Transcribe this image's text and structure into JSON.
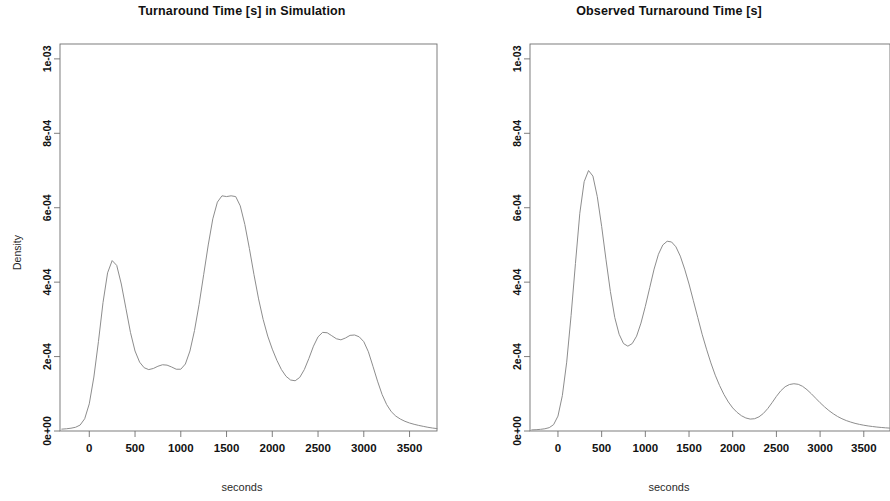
{
  "figure": {
    "background": "#ffffff",
    "line_color": "#8d8d8d",
    "axis_color": "#6f6f6f",
    "text_color": "#111111"
  },
  "panels": [
    {
      "id": "simulation",
      "title": "Turnaround Time [s] in Simulation",
      "xlabel": "seconds",
      "ylabel": "Density"
    },
    {
      "id": "observed",
      "title": "Observed Turnaround Time [s]",
      "xlabel": "seconds",
      "ylabel": "Density"
    }
  ],
  "axis": {
    "x_ticks": [
      0,
      500,
      1000,
      1500,
      2000,
      2500,
      3000,
      3500
    ],
    "x_tick_labels": [
      "0",
      "500",
      "1000",
      "1500",
      "2000",
      "2500",
      "3000",
      "3500"
    ],
    "y_ticks": [
      0,
      0.0002,
      0.0004,
      0.0006,
      0.0008,
      0.001
    ],
    "y_tick_labels": [
      "0e+00",
      "2e-04",
      "4e-04",
      "6e-04",
      "8e-04",
      "1e-03"
    ],
    "xlim": [
      -320,
      3800
    ],
    "ylim": [
      0,
      0.00104
    ]
  },
  "chart_data": [
    {
      "type": "line",
      "title": "Turnaround Time [s] in Simulation",
      "xlabel": "seconds",
      "ylabel": "Density",
      "xlim": [
        -320,
        3800
      ],
      "ylim": [
        0,
        0.00104
      ],
      "grid": false,
      "legend": "none",
      "x": [
        -300,
        -250,
        -200,
        -150,
        -100,
        -50,
        0,
        50,
        100,
        150,
        200,
        250,
        300,
        350,
        400,
        450,
        500,
        550,
        600,
        650,
        700,
        750,
        800,
        850,
        900,
        950,
        1000,
        1050,
        1100,
        1150,
        1200,
        1250,
        1300,
        1350,
        1400,
        1450,
        1500,
        1550,
        1600,
        1650,
        1700,
        1750,
        1800,
        1850,
        1900,
        1950,
        2000,
        2050,
        2100,
        2150,
        2200,
        2250,
        2300,
        2350,
        2400,
        2450,
        2500,
        2550,
        2600,
        2650,
        2700,
        2750,
        2800,
        2850,
        2900,
        2950,
        3000,
        3050,
        3100,
        3150,
        3200,
        3250,
        3300,
        3350,
        3400,
        3450,
        3500,
        3550,
        3600,
        3650,
        3700,
        3750,
        3800
      ],
      "y": [
        5e-06,
        6e-06,
        7.5e-06,
        1e-05,
        1.6e-05,
        3.3e-05,
        7.3e-05,
        0.000145,
        0.00024,
        0.000345,
        0.000425,
        0.000458,
        0.000445,
        0.000395,
        0.00033,
        0.000265,
        0.000215,
        0.000185,
        0.00017,
        0.000165,
        0.000168,
        0.000174,
        0.000178,
        0.000177,
        0.000172,
        0.000166,
        0.000166,
        0.00018,
        0.000215,
        0.00027,
        0.00034,
        0.00042,
        0.0005,
        0.00057,
        0.000615,
        0.000632,
        0.00063,
        0.000632,
        0.00063,
        0.000605,
        0.000555,
        0.00049,
        0.00042,
        0.000355,
        0.0003,
        0.000255,
        0.00022,
        0.00019,
        0.000165,
        0.000147,
        0.000137,
        0.000135,
        0.000144,
        0.000165,
        0.000195,
        0.000228,
        0.000253,
        0.000265,
        0.000264,
        0.000256,
        0.000248,
        0.000245,
        0.00025,
        0.000257,
        0.000258,
        0.000253,
        0.00024,
        0.000213,
        0.000174,
        0.000134,
        9.8e-05,
        7.1e-05,
        5.2e-05,
        4e-05,
        3.2e-05,
        2.6e-05,
        2.15e-05,
        1.8e-05,
        1.5e-05,
        1.25e-05,
        1e-05,
        8e-06,
        6.5e-06
      ],
      "peaks": [
        {
          "x": 250,
          "y": 0.000458
        },
        {
          "x": 1550,
          "y": 0.000632
        },
        {
          "x": 2600,
          "y": 0.000265
        },
        {
          "x": 2900,
          "y": 0.000258
        }
      ]
    },
    {
      "type": "line",
      "title": "Observed Turnaround Time [s]",
      "xlabel": "seconds",
      "ylabel": "Density",
      "xlim": [
        -320,
        3800
      ],
      "ylim": [
        0,
        0.00104
      ],
      "grid": false,
      "legend": "none",
      "x": [
        -300,
        -250,
        -200,
        -150,
        -100,
        -50,
        0,
        50,
        100,
        150,
        200,
        250,
        300,
        350,
        400,
        450,
        500,
        550,
        600,
        650,
        700,
        750,
        800,
        850,
        900,
        950,
        1000,
        1050,
        1100,
        1150,
        1200,
        1250,
        1300,
        1350,
        1400,
        1450,
        1500,
        1550,
        1600,
        1650,
        1700,
        1750,
        1800,
        1850,
        1900,
        1950,
        2000,
        2050,
        2100,
        2150,
        2200,
        2250,
        2300,
        2350,
        2400,
        2450,
        2500,
        2550,
        2600,
        2650,
        2700,
        2750,
        2800,
        2850,
        2900,
        2950,
        3000,
        3050,
        3100,
        3150,
        3200,
        3250,
        3300,
        3350,
        3400,
        3450,
        3500,
        3550,
        3600,
        3650,
        3700,
        3750,
        3800
      ],
      "y": [
        3e-06,
        3.5e-06,
        4.5e-06,
        6e-06,
        9e-06,
        1.7e-05,
        4e-05,
        9.5e-05,
        0.000185,
        0.00031,
        0.00045,
        0.000585,
        0.00067,
        0.0007,
        0.000685,
        0.00063,
        0.00055,
        0.00046,
        0.000375,
        0.000305,
        0.00026,
        0.000235,
        0.000228,
        0.000235,
        0.000255,
        0.00029,
        0.000335,
        0.000385,
        0.000435,
        0.000475,
        0.0005,
        0.00051,
        0.000508,
        0.000495,
        0.00047,
        0.000435,
        0.000395,
        0.00035,
        0.000305,
        0.00026,
        0.00022,
        0.000183,
        0.00015,
        0.000122,
        9.8e-05,
        7.8e-05,
        6.2e-05,
        5e-05,
        4.1e-05,
        3.5e-05,
        3.2e-05,
        3.3e-05,
        3.8e-05,
        4.7e-05,
        6e-05,
        7.6e-05,
        9.3e-05,
        0.000108,
        0.000119,
        0.000125,
        0.000127,
        0.0001255,
        0.00012,
        0.000111,
        0.0001,
        8.8e-05,
        7.6e-05,
        6.5e-05,
        5.5e-05,
        4.65e-05,
        3.9e-05,
        3.3e-05,
        2.8e-05,
        2.4e-05,
        2.05e-05,
        1.78e-05,
        1.55e-05,
        1.36e-05,
        1.2e-05,
        1.06e-05,
        9.5e-06,
        8.5e-06,
        7.7e-06
      ],
      "peaks": [
        {
          "x": 350,
          "y": 0.0007
        },
        {
          "x": 1250,
          "y": 0.00051
        },
        {
          "x": 2700,
          "y": 0.000127
        }
      ]
    }
  ]
}
